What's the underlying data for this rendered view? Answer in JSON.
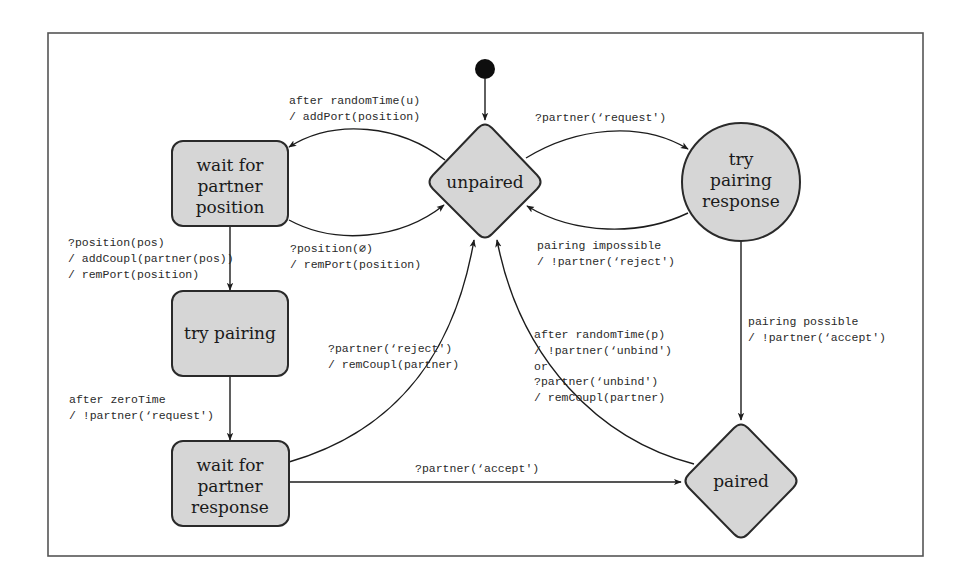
{
  "diagram": {
    "type": "state-machine",
    "colors": {
      "node_fill": "#d6d6d6",
      "node_stroke": "#2a2a2a",
      "edge": "#1c1c1c",
      "frame": "#555555",
      "initial": "#0e0e0e"
    },
    "nodes": {
      "wait_position": {
        "shape": "rounded-rect",
        "lines": [
          "wait for",
          "partner",
          "position"
        ]
      },
      "unpaired": {
        "shape": "diamond",
        "lines": [
          "unpaired"
        ]
      },
      "try_pairing_response": {
        "shape": "circle",
        "lines": [
          "try",
          "pairing",
          "response"
        ]
      },
      "try_pairing": {
        "shape": "rounded-rect",
        "lines": [
          "try pairing"
        ]
      },
      "wait_response": {
        "shape": "rounded-rect",
        "lines": [
          "wait for",
          "partner",
          "response"
        ]
      },
      "paired": {
        "shape": "diamond",
        "lines": [
          "paired"
        ]
      }
    },
    "edges": {
      "unpaired_to_wait_position": {
        "from": "unpaired",
        "to": "wait_position",
        "lines": [
          "after randomTime(u)",
          "/ addPort(position)"
        ]
      },
      "wait_position_to_unpaired": {
        "from": "wait_position",
        "to": "unpaired",
        "lines": [
          "?position(∅)",
          "/ remPort(position)"
        ]
      },
      "unpaired_to_try_response": {
        "from": "unpaired",
        "to": "try_pairing_response",
        "lines": [
          "?partner(‘request')"
        ]
      },
      "try_response_to_unpaired": {
        "from": "try_pairing_response",
        "to": "unpaired",
        "lines": [
          "pairing impossible",
          "/ !partner(‘reject')"
        ]
      },
      "wait_position_to_try_pairing": {
        "from": "wait_position",
        "to": "try_pairing",
        "lines": [
          "?position(pos)",
          "/ addCoupl(partner(pos))",
          "/ remPort(position)"
        ]
      },
      "try_pairing_to_wait_response": {
        "from": "try_pairing",
        "to": "wait_response",
        "lines": [
          "after zeroTime",
          "/ !partner(‘request')"
        ]
      },
      "wait_response_to_unpaired": {
        "from": "wait_response",
        "to": "unpaired",
        "lines": [
          "?partner(‘reject')",
          "/ remCoupl(partner)"
        ]
      },
      "wait_response_to_paired": {
        "from": "wait_response",
        "to": "paired",
        "lines": [
          "?partner(‘accept')"
        ]
      },
      "try_response_to_paired": {
        "from": "try_pairing_response",
        "to": "paired",
        "lines": [
          "pairing possible",
          "/ !partner(‘accept')"
        ]
      },
      "paired_to_unpaired": {
        "from": "paired",
        "to": "unpaired",
        "lines": [
          "after randomTime(p)",
          "/ !partner(‘unbind')",
          "or",
          "?partner(‘unbind')",
          "/ remCoupl(partner)"
        ]
      }
    },
    "initial_state": "unpaired"
  }
}
